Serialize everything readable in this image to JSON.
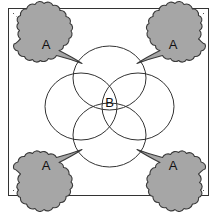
{
  "figure": {
    "title": "",
    "background_color": "#ffffff",
    "frame": {
      "name": "outer-frame",
      "x": 8,
      "y": 8,
      "width": 201,
      "height": 188,
      "stroke": "#333333",
      "stroke_width": 1,
      "fill": "#ffffff"
    },
    "palette": {
      "blob_fill": "#a6a6a6",
      "blob_stroke": "#3a3a3a",
      "circle_stroke": "#333333",
      "label_color": "#111111",
      "tick_color": "#555555"
    }
  },
  "labels": {
    "blob_label": "A",
    "center_label": "B"
  },
  "blobs": [
    {
      "name": "blob-top-left",
      "label": "A",
      "label_x": 46,
      "label_y": 46,
      "orientation": "top-left",
      "tail_target_x": 73,
      "tail_target_y": 73
    },
    {
      "name": "blob-top-right",
      "label": "A",
      "label_x": 173,
      "label_y": 46,
      "orientation": "top-right",
      "tail_target_x": 146,
      "tail_target_y": 73
    },
    {
      "name": "blob-bottom-left",
      "label": "A",
      "label_x": 46,
      "label_y": 167,
      "orientation": "bottom-left",
      "tail_target_x": 73,
      "tail_target_y": 140
    },
    {
      "name": "blob-bottom-right",
      "label": "A",
      "label_x": 173,
      "label_y": 167,
      "orientation": "bottom-right",
      "tail_target_x": 146,
      "tail_target_y": 140
    }
  ],
  "rosette": {
    "name": "center-rosette",
    "center_x": 109.5,
    "center_y": 106.5,
    "node_points": [
      {
        "name": "node-top-left",
        "x": 73,
        "y": 73
      },
      {
        "name": "node-top-right",
        "x": 146,
        "y": 73
      },
      {
        "name": "node-bottom-left",
        "x": 73,
        "y": 140
      },
      {
        "name": "node-bottom-right",
        "x": 146,
        "y": 140
      }
    ],
    "circles": [
      {
        "name": "circle-top",
        "cx": 109.5,
        "cy": 78,
        "rx": 36.5,
        "ry": 32
      },
      {
        "name": "circle-bottom",
        "cx": 109.5,
        "cy": 135,
        "rx": 36.5,
        "ry": 32
      },
      {
        "name": "circle-left",
        "cx": 81,
        "cy": 106.5,
        "rx": 36,
        "ry": 33.5
      },
      {
        "name": "circle-right",
        "cx": 138,
        "cy": 106.5,
        "rx": 36,
        "ry": 33.5
      }
    ],
    "center_label_x": 109.5,
    "center_label_y": 104
  },
  "corner_ticks": [
    {
      "name": "corner-tick-top-left",
      "x1": 13,
      "y1": 13,
      "x2": 31,
      "y2": 31
    },
    {
      "name": "corner-tick-top-right",
      "x1": 204,
      "y1": 13,
      "x2": 186,
      "y2": 31
    },
    {
      "name": "corner-tick-bottom-left",
      "x1": 13,
      "y1": 191,
      "x2": 31,
      "y2": 173
    },
    {
      "name": "corner-tick-bottom-right",
      "x1": 204,
      "y1": 191,
      "x2": 186,
      "y2": 173
    }
  ]
}
